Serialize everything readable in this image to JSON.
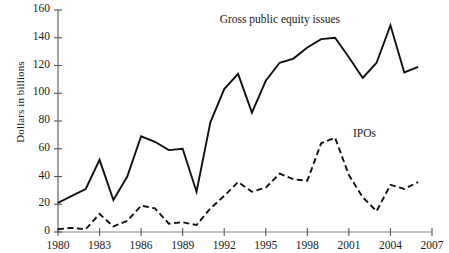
{
  "chart_data": {
    "type": "line",
    "title": "",
    "subtitle": "",
    "xlabel": "",
    "ylabel": "Dollars in billions",
    "xlim": [
      1980,
      2007
    ],
    "ylim": [
      0,
      160
    ],
    "grid": false,
    "legend_position": "inline-annotations",
    "x_tick_labels": [
      "1980",
      "1983",
      "1986",
      "1989",
      "1992",
      "1995",
      "1998",
      "2001",
      "2004",
      "2007"
    ],
    "x_ticks": [
      1980,
      1983,
      1986,
      1989,
      1992,
      1995,
      1998,
      2001,
      2004,
      2007
    ],
    "y_tick_labels": [
      "0",
      "20",
      "40",
      "60",
      "80",
      "100",
      "120",
      "140",
      "160"
    ],
    "y_ticks": [
      0,
      20,
      40,
      60,
      80,
      100,
      120,
      140,
      160
    ],
    "x": [
      1980,
      1981,
      1982,
      1983,
      1984,
      1985,
      1986,
      1987,
      1988,
      1989,
      1990,
      1991,
      1992,
      1993,
      1994,
      1995,
      1996,
      1997,
      1998,
      1999,
      2000,
      2001,
      2002,
      2003,
      2004,
      2005,
      2006
    ],
    "series": [
      {
        "name": "Gross public equity issues",
        "style": "solid",
        "color": "#111111",
        "label_x": 1996,
        "label_y": 152,
        "values": [
          21,
          26,
          31,
          52,
          23,
          40,
          69,
          65,
          59,
          60,
          29,
          79,
          103,
          114,
          86,
          109,
          122,
          125,
          133,
          139,
          140,
          126,
          111,
          122,
          149,
          115,
          119
        ]
      },
      {
        "name": "IPOs",
        "style": "dashed",
        "color": "#111111",
        "label_x": 2001.3,
        "label_y": 70,
        "values": [
          2,
          3,
          2,
          13,
          4,
          8,
          19,
          17,
          6,
          7,
          5,
          17,
          26,
          36,
          29,
          32,
          42,
          38,
          37,
          64,
          68,
          41,
          25,
          15,
          34,
          31,
          36
        ]
      }
    ]
  }
}
